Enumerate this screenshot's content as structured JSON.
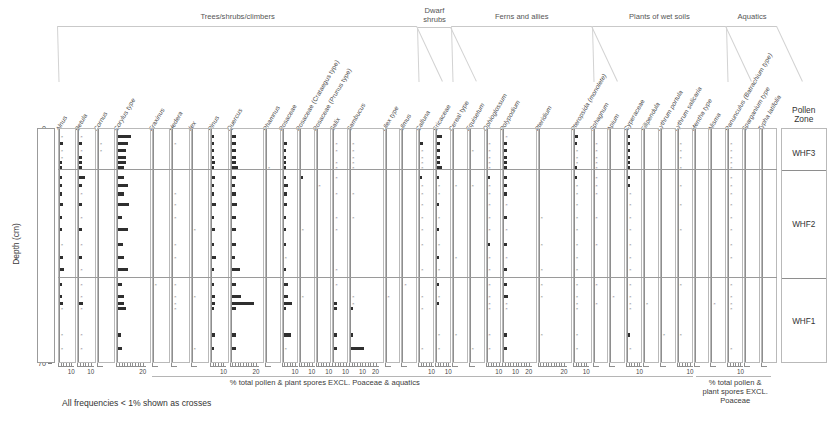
{
  "figure": {
    "footnote": "All frequencies < 1% shown as crosses",
    "depth_axis_title": "Depth (cm)",
    "depth_ticks": [
      0,
      10,
      20,
      30,
      40,
      50,
      60,
      70
    ],
    "depth_min": 0,
    "depth_max": 70,
    "main_caption": "% total pollen & plant spores EXCL. Poaceae & aquatics",
    "right_caption": "% total pollen & plant spores EXCL. Poaceae",
    "zone_header": "Pollen\nZone",
    "zone_header_line1": "Pollen",
    "zone_header_line2": "Zone",
    "bar_color": "#2f2f2f",
    "axis_color": "#8e8e8e",
    "frame_color": "#b9b9b9"
  },
  "groups": [
    {
      "label": "Trees/shrubs/climbers",
      "first": 0,
      "last": 16
    },
    {
      "label": "Dwarf shrubs",
      "first": 17,
      "last": 18
    },
    {
      "label": "Ferns and allies",
      "first": 19,
      "last": 24
    },
    {
      "label": "Plants of wet soils",
      "first": 25,
      "last": 32
    },
    {
      "label": "Aquatics",
      "first": 33,
      "last": 35
    }
  ],
  "zones": [
    {
      "name": "WHF3",
      "top": 0,
      "bottom": 12.5
    },
    {
      "name": "WHF2",
      "top": 12.5,
      "bottom": 44.5
    },
    {
      "name": "WHF1",
      "top": 44.5,
      "bottom": 70
    }
  ],
  "depths": [
    2.5,
    4.5,
    6.5,
    8.5,
    10,
    11.5,
    14.5,
    17,
    19.5,
    22.5,
    26.5,
    30,
    34.5,
    38.5,
    42,
    46.5,
    50,
    52,
    53.5,
    61.5,
    65.5
  ],
  "chart_data": {
    "type": "bar",
    "title": "",
    "xlabel": "% total pollen & plant spores EXCL. Poaceae & aquatics",
    "ylabel": "Depth (cm)",
    "ylim": [
      70,
      0
    ],
    "grid": false,
    "legend": "none",
    "note": "Stratigraphic pollen percentage diagram; one horizontal bar per sample depth per taxon. Values <1% drawn as crosses.",
    "taxa": [
      {
        "name": "Alnus",
        "italic": true,
        "xmax": 14,
        "ticks": [
          10
        ],
        "values": [
          0.4,
          2.2,
          0.8,
          0.9,
          1.2,
          1.6,
          1.7,
          1.2,
          1.4,
          2.4,
          1.5,
          1.6,
          0.5,
          1.9,
          3.2,
          1.3,
          1.8,
          2.3,
          0.4,
          0.5,
          0.5
        ]
      },
      {
        "name": "Betula",
        "italic": true,
        "xmax": 14,
        "ticks": [
          10
        ],
        "values": [
          0.5,
          1.8,
          0.5,
          1.7,
          1.6,
          1.6,
          4.2,
          1.3,
          0.5,
          1.8,
          0.4,
          2.1,
          0.5,
          1.5,
          0.5,
          0.5,
          0.4,
          3.0,
          0.5,
          0.5,
          0.4
        ]
      },
      {
        "name": "Cornus",
        "italic": true,
        "xmax": 14,
        "ticks": [],
        "values": [
          0,
          0.4,
          0.4,
          0,
          0,
          0,
          0,
          0,
          0,
          0,
          0,
          0,
          0,
          0,
          0,
          0,
          0,
          0,
          0,
          0,
          0
        ]
      },
      {
        "name": "Corylus type",
        "italic": true,
        "xmax": 26,
        "ticks": [
          20
        ],
        "values": [
          9.5,
          7.0,
          5.5,
          6.0,
          5.5,
          4.0,
          4.5,
          7.5,
          4.0,
          8.0,
          3.0,
          7.5,
          3.5,
          4.0,
          7.0,
          3.0,
          4.5,
          4.0,
          5.5,
          2.0,
          3.0
        ]
      },
      {
        "name": "Fraxinus",
        "italic": true,
        "xmax": 14,
        "ticks": [],
        "values": [
          0,
          0,
          0,
          0,
          0,
          0,
          0,
          0,
          0,
          0,
          0,
          0,
          0,
          0,
          0,
          0.4,
          0,
          0,
          0,
          0,
          0
        ]
      },
      {
        "name": "Hedera",
        "italic": true,
        "xmax": 14,
        "ticks": [],
        "values": [
          0,
          0.4,
          0,
          0,
          0,
          0,
          0,
          0,
          0.4,
          0.4,
          0.4,
          0,
          0.4,
          0.4,
          0,
          0.4,
          0.4,
          0.4,
          0.4,
          0,
          0
        ]
      },
      {
        "name": "Ilex",
        "italic": true,
        "xmax": 14,
        "ticks": [],
        "values": [
          0,
          0,
          0,
          0,
          0,
          0,
          0,
          0,
          0,
          0,
          0,
          0.4,
          0,
          0,
          0,
          0,
          0.4,
          0,
          0,
          0,
          0.4
        ]
      },
      {
        "name": "Pinus",
        "italic": true,
        "xmax": 14,
        "ticks": [
          10
        ],
        "values": [
          1.5,
          1.7,
          1.6,
          1.6,
          2.0,
          1.2,
          2.4,
          1.3,
          1.7,
          2.6,
          1.5,
          1.8,
          1.6,
          2.6,
          1.6,
          1.7,
          1.8,
          2.0,
          1.4,
          2.4,
          1.7
        ]
      },
      {
        "name": "Quercus",
        "italic": true,
        "xmax": 26,
        "ticks": [
          20
        ],
        "values": [
          3.0,
          3.0,
          3.0,
          3.0,
          3.0,
          4.5,
          3.5,
          2.5,
          3.0,
          4.0,
          3.0,
          3.5,
          3.0,
          2.5,
          6.5,
          3.0,
          7.0,
          17.0,
          3.0,
          3.5,
          3.0
        ]
      },
      {
        "name": "Rhamnus",
        "italic": true,
        "xmax": 12,
        "ticks": [],
        "values": [
          0,
          0,
          0,
          0,
          0,
          0.4,
          0,
          0,
          0,
          0,
          0,
          0,
          0,
          0,
          0,
          0,
          0,
          0,
          0,
          0,
          0
        ]
      },
      {
        "name": "Rosaceae",
        "italic": false,
        "xmax": 12,
        "ticks": [
          10
        ],
        "values": [
          0,
          2.5,
          1.5,
          2.0,
          2.0,
          1.5,
          2.0,
          3.0,
          2.5,
          2.5,
          2.0,
          1.5,
          2.0,
          0.8,
          1.5,
          3.0,
          3.5,
          6.0,
          1.5,
          5.5,
          0.8
        ]
      },
      {
        "name": "Rosaceae (Crataegus type)",
        "italic": false,
        "xmax": 12,
        "ticks": [
          10
        ],
        "values": [
          0,
          0,
          0,
          0,
          0,
          0,
          1.2,
          0,
          0,
          0,
          0,
          0.4,
          0,
          0,
          0,
          0,
          0.8,
          0,
          0,
          0,
          0
        ]
      },
      {
        "name": "Rosaceae (Prunus type)",
        "italic": false,
        "xmax": 12,
        "ticks": [
          10
        ],
        "values": [
          0,
          0,
          0,
          0,
          0,
          0,
          0,
          0.8,
          0,
          0,
          0,
          0,
          0,
          0,
          0,
          0,
          0,
          0,
          0,
          0,
          0
        ]
      },
      {
        "name": "Salix",
        "italic": true,
        "xmax": 12,
        "ticks": [
          10
        ],
        "values": [
          0,
          0.4,
          0.4,
          0,
          0.8,
          0.8,
          0.8,
          0,
          0.8,
          0,
          0.4,
          0.4,
          0,
          0,
          0.4,
          0.9,
          0,
          1.2,
          1.2,
          1.3,
          1.0
        ]
      },
      {
        "name": "Sambucus",
        "italic": true,
        "xmax": 26,
        "ticks": [
          10,
          20
        ],
        "values": [
          0,
          0.4,
          0.4,
          0.4,
          0.4,
          0.5,
          0,
          0,
          0.4,
          0,
          0.4,
          0,
          0,
          0,
          0,
          0,
          0.4,
          0.4,
          1.2,
          1.2,
          10.0
        ]
      },
      {
        "name": "Ulex type",
        "italic": true,
        "xmax": 12,
        "ticks": [],
        "values": [
          0,
          0,
          0,
          0,
          0,
          0,
          0,
          0,
          0,
          0,
          0,
          0,
          0,
          0,
          0,
          0,
          0.4,
          0,
          0,
          0,
          0
        ]
      },
      {
        "name": "Ulmus",
        "italic": true,
        "xmax": 12,
        "ticks": [],
        "values": [
          0,
          0,
          0,
          0,
          0,
          0,
          0,
          0,
          0,
          0,
          0,
          0,
          0,
          0,
          0,
          0.4,
          0,
          0,
          0,
          0,
          0
        ]
      },
      {
        "name": "Calluna",
        "italic": true,
        "xmax": 12,
        "ticks": [
          10
        ],
        "values": [
          0,
          1.8,
          0.8,
          0.8,
          0.8,
          0.8,
          1.0,
          0.4,
          0.8,
          0.4,
          0.4,
          0.4,
          0.4,
          0,
          0.4,
          0,
          0.4,
          0,
          0.4,
          0,
          0.4
        ]
      },
      {
        "name": "Ericaceae",
        "italic": false,
        "xmax": 12,
        "ticks": [
          10
        ],
        "values": [
          4.0,
          2.0,
          2.0,
          2.0,
          2.0,
          3.5,
          1.5,
          0.5,
          0.4,
          1.5,
          0.4,
          1.5,
          0.4,
          1.5,
          0.4,
          1.5,
          0.4,
          1.5,
          0,
          0.4,
          0.4
        ]
      },
      {
        "name": "Cereal type",
        "italic": false,
        "xmax": 12,
        "ticks": [],
        "values": [
          0,
          0,
          0,
          0,
          0,
          0,
          0,
          0.4,
          0,
          0,
          0,
          0,
          0,
          0.4,
          0,
          0,
          0,
          0,
          0,
          0.4,
          0
        ]
      },
      {
        "name": "Equisetum",
        "italic": true,
        "xmax": 12,
        "ticks": [],
        "values": [
          0,
          0,
          0.4,
          0,
          0,
          0,
          0,
          0.4,
          0,
          0,
          0,
          0,
          0,
          0,
          0,
          0,
          0,
          0,
          0,
          0,
          0.4
        ]
      },
      {
        "name": "Ophioglossum",
        "italic": true,
        "xmax": 12,
        "ticks": [
          10
        ],
        "values": [
          0,
          0.8,
          0.4,
          0.4,
          0.4,
          0.4,
          1.2,
          0.4,
          0.8,
          0.4,
          0.4,
          0.4,
          1.2,
          0.4,
          0.8,
          0.4,
          0.4,
          0.4,
          0.4,
          0.4,
          0.4
        ]
      },
      {
        "name": "Polypodium",
        "italic": true,
        "xmax": 26,
        "ticks": [
          10,
          20
        ],
        "values": [
          0.8,
          1.6,
          1.6,
          1.6,
          1.6,
          1.6,
          1.6,
          1.2,
          1.6,
          0.8,
          1.6,
          0.8,
          1.2,
          0.8,
          1.6,
          1.6,
          3.0,
          0.8,
          0.8,
          1.6,
          1.2,
          9.0
        ]
      },
      {
        "name": "Pteridium",
        "italic": true,
        "xmax": 26,
        "ticks": [
          20
        ],
        "values": [
          0,
          0,
          0,
          0,
          0,
          0,
          0,
          0,
          0,
          0,
          0.4,
          0,
          0.4,
          0,
          0.4,
          0.4,
          0.4,
          0,
          0,
          0.4,
          0
        ]
      },
      {
        "name": "Pteropsida (monolete)",
        "italic": true,
        "xmax": 14,
        "ticks": [
          10
        ],
        "values": [
          2.0,
          1.0,
          0.8,
          0.8,
          0.8,
          1.2,
          1.0,
          0.8,
          0.8,
          0.5,
          0.8,
          0.4,
          0.5,
          0.4,
          0.5,
          0.4,
          0.4,
          0.4,
          0.4,
          0.4,
          0.8
        ]
      },
      {
        "name": "Sphagnum",
        "italic": true,
        "xmax": 12,
        "ticks": [],
        "values": [
          0,
          0.4,
          0.4,
          0.4,
          0.4,
          0.4,
          0.4,
          0.4,
          0.4,
          0,
          0.4,
          0,
          0.4,
          0,
          0,
          0.4,
          0,
          0.4,
          0,
          0,
          0
        ]
      },
      {
        "name": "Apium",
        "italic": true,
        "xmax": 12,
        "ticks": [],
        "values": [
          0,
          0,
          0,
          0,
          0,
          0,
          0,
          0,
          0,
          0,
          0,
          0,
          0,
          0,
          0,
          0,
          0.4,
          0,
          0,
          0,
          0
        ]
      },
      {
        "name": "Cyperaceae",
        "italic": false,
        "xmax": 12,
        "ticks": [
          10
        ],
        "values": [
          1.2,
          1.5,
          1.2,
          1.2,
          1.2,
          1.5,
          1.2,
          1.2,
          0.8,
          0.8,
          0.8,
          0.8,
          0.8,
          0.4,
          0.8,
          0.4,
          0.8,
          0.4,
          0.4,
          1.2,
          0.8
        ]
      },
      {
        "name": "Filipendula",
        "italic": true,
        "xmax": 12,
        "ticks": [],
        "values": [
          0,
          0,
          0,
          0,
          0,
          0,
          0,
          0,
          0,
          0,
          0,
          0,
          0,
          0,
          0,
          0,
          0,
          0.4,
          0,
          0,
          0
        ]
      },
      {
        "name": "Lythrum portula",
        "italic": true,
        "xmax": 12,
        "ticks": [],
        "values": [
          0,
          0,
          0,
          0,
          0,
          0,
          0,
          0,
          0,
          0,
          0,
          0,
          0,
          0,
          0,
          0,
          0,
          0,
          0,
          0.4,
          0
        ]
      },
      {
        "name": "Lythrum salicaria",
        "italic": true,
        "xmax": 12,
        "ticks": [
          10
        ],
        "values": [
          0,
          0.4,
          0.4,
          0.4,
          0,
          0.4,
          0,
          0.4,
          0,
          0.4,
          0,
          0.4,
          0,
          0,
          0,
          0.4,
          0,
          0,
          0,
          0.4,
          0
        ]
      },
      {
        "name": "Mentha type",
        "italic": true,
        "xmax": 12,
        "ticks": [],
        "values": [
          0,
          0,
          0,
          0,
          0,
          0,
          0,
          0,
          0,
          0,
          0,
          0,
          0,
          0,
          0,
          0,
          0,
          0,
          0,
          0,
          0
        ]
      },
      {
        "name": "Alisma",
        "italic": true,
        "xmax": 12,
        "ticks": [],
        "values": [
          0,
          0,
          0,
          0,
          0,
          0,
          0,
          0,
          0,
          0,
          0,
          0,
          0,
          0,
          0,
          0,
          0,
          0.4,
          0,
          0,
          0
        ]
      },
      {
        "name": "Ranunculus (Batrachium type)",
        "italic": true,
        "xmax": 12,
        "ticks": [
          10
        ],
        "values": [
          0,
          0.8,
          0.4,
          0.4,
          0.4,
          0.4,
          0.8,
          0.4,
          0.4,
          0.4,
          0.4,
          0.4,
          0.4,
          0.4,
          0,
          0.4,
          0.4,
          0.8,
          0.4,
          0,
          0.4
        ]
      },
      {
        "name": "Sparganium type",
        "italic": true,
        "xmax": 12,
        "ticks": [],
        "values": [
          0,
          0,
          0,
          0,
          0,
          0,
          0,
          0,
          0,
          0,
          0,
          0,
          0,
          0,
          0,
          0,
          0,
          0,
          0,
          0,
          0
        ]
      },
      {
        "name": "Typha latifolia",
        "italic": true,
        "xmax": 12,
        "ticks": [],
        "values": [
          0,
          0,
          0,
          0,
          0,
          0,
          0,
          0,
          0,
          0,
          0,
          0,
          0,
          0,
          0,
          0,
          0,
          0,
          0,
          0,
          0
        ]
      }
    ]
  }
}
